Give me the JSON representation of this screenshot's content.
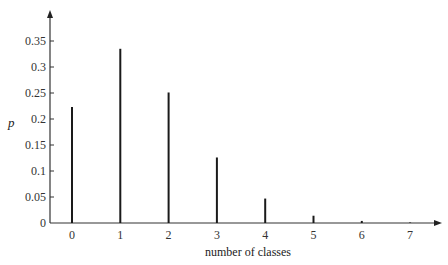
{
  "chart_data": {
    "type": "bar",
    "title": "",
    "xlabel": "number of classes",
    "ylabel": "p",
    "categories": [
      "0",
      "1",
      "2",
      "3",
      "4",
      "5",
      "6",
      "7"
    ],
    "values": [
      0.223,
      0.335,
      0.251,
      0.126,
      0.047,
      0.014,
      0.004,
      0.001
    ],
    "yticks": [
      "0",
      "0.05",
      "0.1",
      "0.15",
      "0.2",
      "0.25",
      "0.3",
      "0.35"
    ],
    "ytick_values": [
      0,
      0.05,
      0.1,
      0.15,
      0.2,
      0.25,
      0.3,
      0.35
    ],
    "ylim": [
      0,
      0.37
    ],
    "grid": false,
    "legend": null,
    "style": "spike"
  },
  "layout": {
    "origin_x": 50,
    "origin_y": 223,
    "px_per_unit_y": 520,
    "first_bar_x": 72,
    "bar_spacing": 48.3,
    "x_axis_end": 442,
    "y_axis_top": 10,
    "color": "#1a1a1a"
  }
}
